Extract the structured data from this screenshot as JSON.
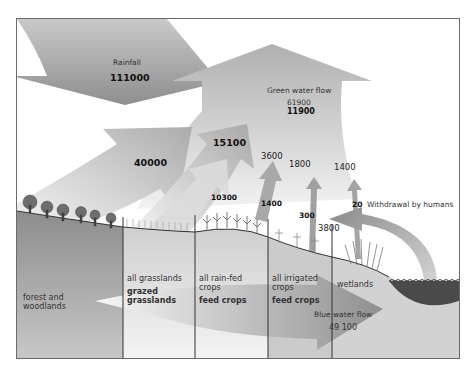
{
  "diagram": {
    "type": "water flow diagram",
    "rainfall": {
      "label": "Rainfall",
      "value": "111000"
    },
    "green_water_flow": {
      "label": "Green water flow",
      "value_total": "61900",
      "value_bold": "11900"
    },
    "blue_water_flow": {
      "label": "Blue water flow",
      "value": "49 100"
    },
    "withdrawal": {
      "value": "20",
      "label": "Withdrawal by humans"
    },
    "flows": {
      "forest": "40000",
      "grasslands_all": "15100",
      "grasslands_grazed": "10300",
      "rainfed_all": "3600",
      "rainfed_feed": "1400",
      "irrigated_all": "1800",
      "irrigated_feed": "300",
      "wetlands": "1400",
      "return_to_land": "3800"
    },
    "regions": [
      {
        "name": "forest and woodlands",
        "sub": ""
      },
      {
        "name": "all grasslands",
        "sub": "grazed grasslands"
      },
      {
        "name": "all rain-fed crops",
        "sub": "feed crops"
      },
      {
        "name": "all irrigated crops",
        "sub": "feed crops"
      },
      {
        "name": "wetlands",
        "sub": ""
      }
    ],
    "colors": {
      "frame": "#6b6b6b",
      "arrow_dark": "#8a8a8a",
      "arrow_light": "#e6e6e6",
      "ground": "#9a9a9a",
      "water": "#4a4a4a"
    }
  }
}
